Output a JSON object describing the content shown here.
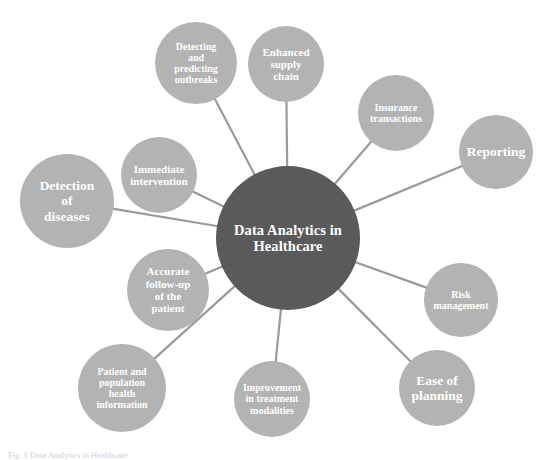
{
  "diagram": {
    "type": "radial-mind-map",
    "background_color": "#ffffff",
    "hub_color": "#5a5a5a",
    "node_color": "#b3b3b3",
    "connector_color": "#9a9a9a",
    "text_color": "#ffffff",
    "hub": {
      "label": "Data Analytics in Healthcare",
      "line1": "Data Analytics in",
      "line2": "Healthcare",
      "cx": 288,
      "cy": 238,
      "r": 72
    },
    "nodes": [
      {
        "id": "detecting-predicting-outbreaks",
        "label": "Detecting and predicting outbreaks",
        "lines": [
          "Detecting",
          "and",
          "predicting",
          "outbreaks"
        ],
        "cx": 196,
        "cy": 63,
        "r": 41,
        "size": "sm"
      },
      {
        "id": "enhanced-supply-chain",
        "label": "Enhanced supply chain",
        "lines": [
          "Enhanced",
          "supply",
          "chain"
        ],
        "cx": 286,
        "cy": 64,
        "r": 38,
        "size": "md"
      },
      {
        "id": "insurance-transactions",
        "label": "Insurance transactions",
        "lines": [
          "Insurance",
          "transactions"
        ],
        "cx": 396,
        "cy": 113,
        "r": 38,
        "size": "sm"
      },
      {
        "id": "reporting",
        "label": "Reporting",
        "lines": [
          "Reporting"
        ],
        "cx": 496,
        "cy": 152,
        "r": 37,
        "size": "lg"
      },
      {
        "id": "risk-management",
        "label": "Risk management",
        "lines": [
          "Risk",
          "management"
        ],
        "cx": 461,
        "cy": 300,
        "r": 37,
        "size": "sm"
      },
      {
        "id": "ease-of-planning",
        "label": "Ease of planning",
        "lines": [
          "Ease of",
          "planning"
        ],
        "cx": 437,
        "cy": 388,
        "r": 38,
        "size": "lg"
      },
      {
        "id": "improvement-in-treatment-modalities",
        "label": "Improvement in treatment modalities",
        "lines": [
          "Improvement",
          "in treatment",
          "modalities"
        ],
        "cx": 272,
        "cy": 399,
        "r": 38,
        "size": "sm"
      },
      {
        "id": "patient-population-health-information",
        "label": "Patient and population health information",
        "lines": [
          "Patient and",
          "population",
          "health",
          "information"
        ],
        "cx": 122,
        "cy": 388,
        "r": 44,
        "size": "sm"
      },
      {
        "id": "accurate-follow-up-of-the-patient",
        "label": "Accurate follow-up of the patient",
        "lines": [
          "Accurate",
          "follow-up",
          "of the",
          "patient"
        ],
        "cx": 168,
        "cy": 290,
        "r": 41,
        "size": "md"
      },
      {
        "id": "detection-of-diseases",
        "label": "Detection of diseases",
        "lines": [
          "Detection",
          "of",
          "diseases"
        ],
        "cx": 67,
        "cy": 201,
        "r": 47,
        "size": "lg"
      },
      {
        "id": "immediate-intervention",
        "label": "Immediate intervention",
        "lines": [
          "Immediate",
          "intervention"
        ],
        "cx": 159,
        "cy": 175,
        "r": 38,
        "size": "md"
      }
    ],
    "caption": "Fig. 1 Data Analytics in Healthcare"
  }
}
